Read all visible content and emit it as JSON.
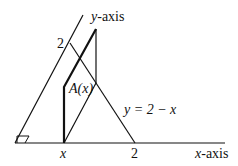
{
  "diagram": {
    "labels": {
      "y_axis": "y-axis",
      "x_axis": "x-axis",
      "y_tick_2": "2",
      "x_tick_2": "2",
      "x_tick_x": "x",
      "area": "A(x)",
      "line_eq": "y = 2 − x"
    },
    "colors": {
      "stroke": "#111111",
      "background": "#ffffff"
    }
  }
}
